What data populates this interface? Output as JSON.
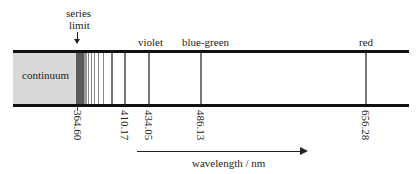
{
  "diagram": {
    "type": "emission-line-spectrum",
    "region_label": "continuum",
    "series_limit_label_line1": "series",
    "series_limit_label_line2": "limit",
    "color_labels": {
      "violet": "violet",
      "blue_green": "blue-green",
      "red": "red"
    },
    "tick_labels": [
      "364.60",
      "410.17",
      "434.05",
      "486.13",
      "656.28"
    ],
    "axis_label": "wavelength / nm",
    "colors": {
      "bar": "#111111",
      "continuum": "#d9d9d9",
      "series_limit_band": "#5a5a5a",
      "lines": "#777777"
    }
  }
}
